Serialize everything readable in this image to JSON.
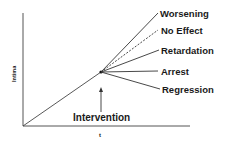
{
  "diagram": {
    "y_axis_label": "Intima",
    "x_axis_label": "t",
    "intervention_label": "Intervention",
    "outcomes": [
      {
        "label": "Worsening",
        "style": "solid"
      },
      {
        "label": "No Effect",
        "style": "dashed"
      },
      {
        "label": "Retardation",
        "style": "solid"
      },
      {
        "label": "Arrest",
        "style": "solid"
      },
      {
        "label": "Regression",
        "style": "solid"
      }
    ]
  },
  "colors": {
    "line": "#333333",
    "text": "#1a1a1a",
    "background": "#ffffff"
  }
}
